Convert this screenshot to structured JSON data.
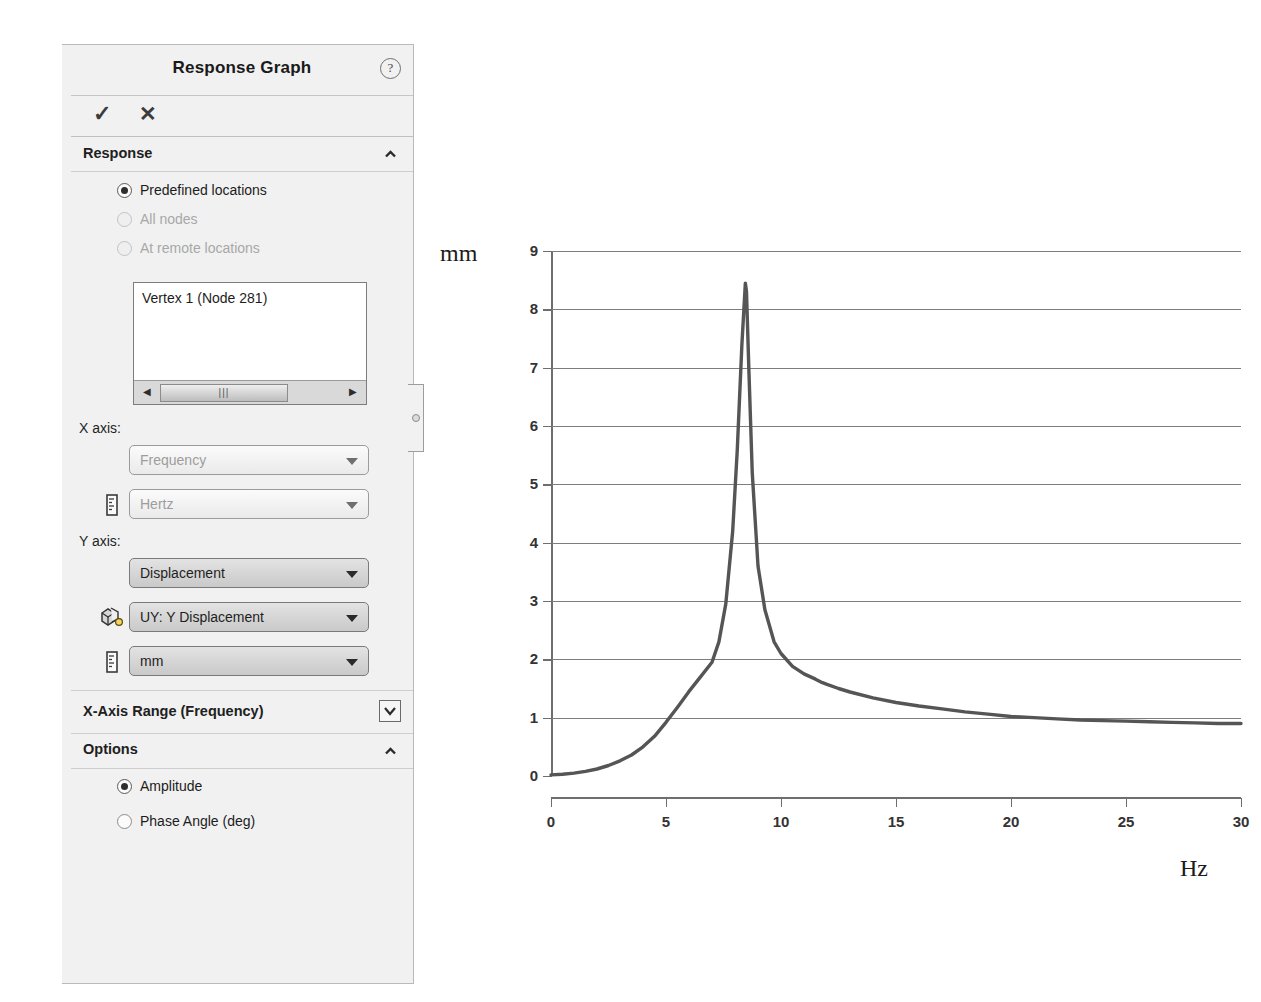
{
  "panel": {
    "title": "Response Graph",
    "help_icon": "question-mark-icon",
    "ok_label": "✓",
    "cancel_label": "✕",
    "sections": {
      "response": {
        "label": "Response",
        "collapse_state": "expanded",
        "radios": [
          {
            "label": "Predefined locations",
            "selected": true,
            "enabled": true
          },
          {
            "label": "All nodes",
            "selected": false,
            "enabled": false
          },
          {
            "label": "At remote locations",
            "selected": false,
            "enabled": false
          }
        ],
        "listbox": {
          "items": [
            "Vertex 1 (Node 281)"
          ],
          "scroll_left_icon": "◀",
          "scroll_right_icon": "▶",
          "thumb_grip": "⦀"
        }
      },
      "axes": {
        "x_axis_label": "X axis:",
        "x_quantity": {
          "value": "Frequency",
          "state": "dim"
        },
        "x_units": {
          "value": "Hertz",
          "state": "dim",
          "icon": "units-ruler-icon"
        },
        "y_axis_label": "Y axis:",
        "y_quantity": {
          "value": "Displacement",
          "state": "active"
        },
        "y_component": {
          "value": "UY: Y Displacement",
          "state": "active",
          "icon": "component-cube-icon"
        },
        "y_units": {
          "value": "mm",
          "state": "active",
          "icon": "units-ruler-icon"
        }
      },
      "x_axis_range": {
        "label": "X-Axis Range  (Frequency)",
        "collapse_state": "collapsed"
      },
      "options": {
        "label": "Options",
        "collapse_state": "expanded",
        "radios": [
          {
            "label": "Amplitude",
            "selected": true,
            "enabled": true
          },
          {
            "label": "Phase Angle (deg)",
            "selected": false,
            "enabled": true
          }
        ]
      }
    }
  },
  "chart_data": {
    "type": "line",
    "title": "",
    "xlabel": "Hz",
    "ylabel": "mm",
    "xlim": [
      0,
      30
    ],
    "ylim": [
      0,
      9
    ],
    "xticks": [
      0,
      5,
      10,
      15,
      20,
      25,
      30
    ],
    "yticks": [
      0,
      1,
      2,
      3,
      4,
      5,
      6,
      7,
      8,
      9
    ],
    "grid": "horizontal",
    "legend": "none",
    "line_color": "#555555",
    "series": [
      {
        "name": "UY: Y Displacement",
        "x": [
          0,
          0.5,
          1,
          1.5,
          2,
          2.5,
          3,
          3.5,
          4,
          4.5,
          5,
          5.5,
          6,
          6.5,
          7,
          7.3,
          7.6,
          7.9,
          8.1,
          8.3,
          8.45,
          8.5,
          8.6,
          8.75,
          9,
          9.3,
          9.7,
          10,
          10.5,
          11,
          11.5,
          11.8,
          12,
          12.5,
          13,
          14,
          15,
          16,
          17,
          18,
          19,
          20,
          21,
          22,
          23,
          24,
          25,
          26,
          27,
          28,
          29,
          30
        ],
        "y": [
          0.02,
          0.03,
          0.05,
          0.08,
          0.12,
          0.18,
          0.26,
          0.36,
          0.5,
          0.68,
          0.92,
          1.18,
          1.45,
          1.7,
          1.95,
          2.3,
          2.95,
          4.2,
          5.6,
          7.4,
          8.45,
          8.3,
          7.0,
          5.2,
          3.6,
          2.85,
          2.3,
          2.1,
          1.88,
          1.75,
          1.66,
          1.6,
          1.57,
          1.5,
          1.44,
          1.34,
          1.26,
          1.2,
          1.15,
          1.1,
          1.06,
          1.02,
          1.0,
          0.98,
          0.96,
          0.95,
          0.94,
          0.93,
          0.92,
          0.91,
          0.9,
          0.9
        ]
      }
    ]
  }
}
